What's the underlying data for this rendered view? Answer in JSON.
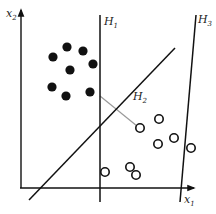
{
  "axes": {
    "x_label": "x",
    "x_sub": "1",
    "y_label": "x",
    "y_sub": "2"
  },
  "hyperplanes": [
    {
      "name": "H",
      "sub": "1",
      "x1": 100,
      "y1": 15,
      "x2": 100,
      "y2": 202,
      "lx": 104,
      "ly": 25
    },
    {
      "name": "H",
      "sub": "2",
      "x1": 29,
      "y1": 200,
      "x2": 175,
      "y2": 48,
      "lx": 133,
      "ly": 100
    },
    {
      "name": "H",
      "sub": "3",
      "x1": 196,
      "y1": 15,
      "x2": 180,
      "y2": 202,
      "lx": 198,
      "ly": 23
    }
  ],
  "margin_line": {
    "x1": 100,
    "y1": 96,
    "x2": 137,
    "y2": 126,
    "color": "#9a9a9a"
  },
  "class_filled": {
    "color": "#111111",
    "points": [
      [
        67,
        47
      ],
      [
        53,
        57
      ],
      [
        83,
        51
      ],
      [
        70,
        70
      ],
      [
        93,
        64
      ],
      [
        52,
        87
      ],
      [
        66,
        96
      ],
      [
        90,
        92
      ]
    ]
  },
  "class_open": {
    "color": "#111111",
    "points": [
      [
        140,
        128
      ],
      [
        159,
        119
      ],
      [
        158,
        144
      ],
      [
        174,
        138
      ],
      [
        191,
        148
      ],
      [
        105,
        172
      ],
      [
        130,
        167
      ],
      [
        136,
        175
      ]
    ]
  }
}
